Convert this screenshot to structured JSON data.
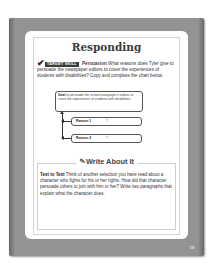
{
  "page": {
    "title": "Responding",
    "target_skill": {
      "badge": "TARGET SKILL",
      "skill_name": "Persuasion",
      "question": "What reasons does Tyler give to persuade the newspaper editors to cover the experiences of students with disabilities? Copy and complete the chart below."
    },
    "chart": {
      "goal_label": "Goal",
      "goal_text": "to persuade the school newspaper's editors to cover the experiences of students with disabilities",
      "reasons": [
        {
          "label": "Reason 1",
          "value": "?"
        },
        {
          "label": "Reason 2",
          "value": "?"
        }
      ]
    },
    "write_about_it": {
      "title": "Write About It",
      "lead": "Text to Text",
      "text": "Think of another selection you have read about a character who fights for his or her rights. How did that character persuade others to join with him or her? Write two paragraphs that explain what the character does."
    },
    "page_number": "19"
  }
}
